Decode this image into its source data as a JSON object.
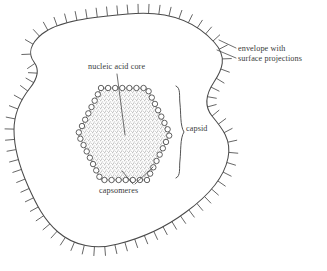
{
  "figure": {
    "type": "line-drawing",
    "background_color": "#ffffff",
    "ink_color": "#3a3a3a",
    "stipple_color": "#b9b9b9"
  },
  "labels": {
    "envelope_line1": "envelope with",
    "envelope_line2": "surface projections",
    "nucleic_acid_core": "nucleic acid core",
    "capsid": "capsid",
    "capsomeres": "capsomeres"
  },
  "structures": {
    "envelope": {
      "name": "envelope with surface projections",
      "shape": "irregular closed blob outline",
      "spike_count": 72,
      "spike_length_px": 9
    },
    "capsid": {
      "name": "capsid",
      "shape": "hexagon ringed by capsomere circles",
      "capsomere_count": 42,
      "capsomere_radius_px": 2.7,
      "fill": "stippled gray"
    },
    "nucleic_acid_core": {
      "name": "nucleic acid core",
      "shape": "stippled hexagonal interior"
    }
  }
}
